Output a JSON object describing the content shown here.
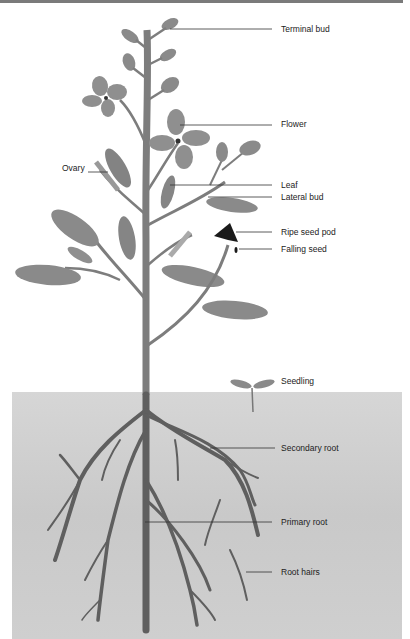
{
  "diagram": {
    "type": "labeled plant anatomy illustration",
    "colors": {
      "plant": "#7d7d7d",
      "plant_dark": "#555555",
      "seed_pod": "#1a1a1a",
      "soil": "#cfcfcf",
      "leader_line": "#333333",
      "label_text": "#222222"
    },
    "labels": {
      "terminal_bud": "Terminal bud",
      "flower": "Flower",
      "ovary": "Ovary",
      "leaf": "Leaf",
      "lateral_bud": "Lateral bud",
      "ripe_seed_pod": "Ripe seed pod",
      "falling_seed": "Falling seed",
      "seedling": "Seedling",
      "secondary_root": "Secondary root",
      "primary_root": "Primary root",
      "root_hairs": "Root hairs"
    }
  }
}
